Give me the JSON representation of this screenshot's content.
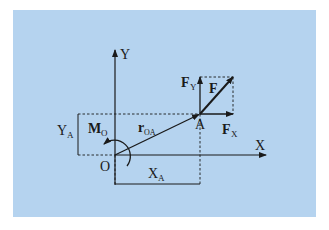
{
  "diagram": {
    "background_color": "#b5d3ef",
    "line_color": "#1a1a1a",
    "labels": {
      "y_axis": "Y",
      "x_axis": "X",
      "origin": "O",
      "point": "A",
      "force": "F",
      "force_y": "F",
      "force_y_sub": "Y",
      "force_x": "F",
      "force_x_sub": "X",
      "position_vector": "r",
      "position_vector_sub": "OA",
      "moment": "M",
      "moment_sub": "O",
      "dim_y": "Y",
      "dim_y_sub": "A",
      "dim_x": "X",
      "dim_x_sub": "A"
    }
  }
}
